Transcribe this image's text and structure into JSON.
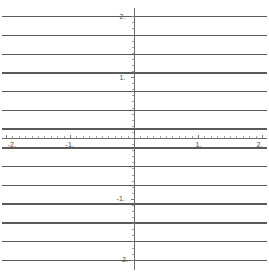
{
  "chart_data": {
    "type": "line",
    "title": "",
    "xlabel": "",
    "ylabel": "",
    "xlim": [
      -2.07,
      2.07
    ],
    "ylim": [
      -2.07,
      2.07
    ],
    "grid": false,
    "legend": null,
    "axes": {
      "x_axis_y_value": 0,
      "y_axis_x_value": 0,
      "x_tick_labels": [
        "-2.",
        "-1.",
        "1.",
        "2."
      ],
      "x_tick_values": [
        -2,
        -1,
        1,
        2
      ],
      "y_tick_labels": [
        "2.",
        "1.",
        "-1.",
        "-2."
      ],
      "y_tick_values": [
        2,
        1,
        -1,
        -2
      ],
      "x_minor_tick_step": 0.1,
      "y_minor_tick_step": 0.1
    },
    "series": [
      {
        "name": "y = 2.00",
        "type": "horizontal-line",
        "y": 2.0,
        "x": [
          -2.07,
          2.07
        ]
      },
      {
        "name": "y = 1.69",
        "type": "horizontal-line",
        "y": 1.69,
        "x": [
          -2.07,
          2.07
        ]
      },
      {
        "name": "y = 1.385",
        "type": "horizontal-line",
        "y": 1.385,
        "x": [
          -2.07,
          2.07
        ]
      },
      {
        "name": "y = 1.075",
        "type": "horizontal-line",
        "y": 1.075,
        "x": [
          -2.07,
          2.07
        ]
      },
      {
        "name": "y = 0.77",
        "type": "horizontal-line",
        "y": 0.77,
        "x": [
          -2.07,
          2.07
        ]
      },
      {
        "name": "y = 0.46",
        "type": "horizontal-line",
        "y": 0.46,
        "x": [
          -2.07,
          2.07
        ]
      },
      {
        "name": "y = 0.155",
        "type": "horizontal-line",
        "y": 0.155,
        "x": [
          -2.07,
          2.07
        ]
      },
      {
        "name": "y = -0.155",
        "type": "horizontal-line",
        "y": -0.155,
        "x": [
          -2.07,
          2.07
        ]
      },
      {
        "name": "y = -0.46",
        "type": "horizontal-line",
        "y": -0.46,
        "x": [
          -2.07,
          2.07
        ]
      },
      {
        "name": "y = -0.77",
        "type": "horizontal-line",
        "y": -0.77,
        "x": [
          -2.07,
          2.07
        ]
      },
      {
        "name": "y = -1.075",
        "type": "horizontal-line",
        "y": -1.075,
        "x": [
          -2.07,
          2.07
        ]
      },
      {
        "name": "y = -1.385",
        "type": "horizontal-line",
        "y": -1.385,
        "x": [
          -2.07,
          2.07
        ]
      },
      {
        "name": "y = -1.69",
        "type": "horizontal-line",
        "y": -1.69,
        "x": [
          -2.07,
          2.07
        ]
      },
      {
        "name": "y = -2.00",
        "type": "horizontal-line",
        "y": -2.0,
        "x": [
          -2.07,
          2.07
        ]
      }
    ]
  },
  "labels": {
    "x": {
      "neg_two": "-2.",
      "neg_one": "-1.",
      "pos_one": "1.",
      "pos_two": "2."
    },
    "y": {
      "pos_two": "2.",
      "pos_one": "1.",
      "neg_one": "-1.",
      "neg_two": "-2."
    }
  },
  "colors": {
    "background": "#ffffff",
    "series_line": "#5a5a5a",
    "axis": "#6b6b6b",
    "tick": "#7a7a7a",
    "label_text": "#4d4d4d"
  }
}
